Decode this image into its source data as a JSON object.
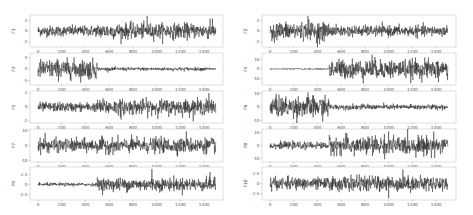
{
  "chart_data": [
    {
      "type": "line",
      "panel": "left-1",
      "ylabel": "F1",
      "x_range": [
        0,
        1500
      ],
      "xticks": [
        0,
        200,
        400,
        600,
        800,
        1000,
        1200,
        1400
      ],
      "yticks": [
        -2,
        0,
        2
      ],
      "ylim": [
        -3,
        3
      ],
      "segments": [
        {
          "from": 0,
          "to": 500,
          "amp": 0.9
        },
        {
          "from": 500,
          "to": 1500,
          "amp": 1.3
        }
      ],
      "spikes": [
        [
          920,
          2.8
        ],
        [
          1450,
          2.3
        ]
      ]
    },
    {
      "type": "line",
      "panel": "left-2",
      "ylabel": "F3",
      "x_range": [
        0,
        1500
      ],
      "xticks": [
        0,
        200,
        400,
        600,
        800,
        1000,
        1200,
        1400
      ],
      "yticks": [
        -5,
        0,
        5
      ],
      "ylim": [
        -7,
        7
      ],
      "segments": [
        {
          "from": 0,
          "to": 500,
          "amp": 3.8
        },
        {
          "from": 500,
          "to": 1500,
          "amp": 0.7
        }
      ],
      "spikes": [
        [
          440,
          -4.5
        ]
      ]
    },
    {
      "type": "line",
      "panel": "left-3",
      "ylabel": "F5",
      "x_range": [
        0,
        1500
      ],
      "xticks": [
        0,
        200,
        400,
        600,
        800,
        1000,
        1200,
        1400
      ],
      "yticks": [
        -2,
        0,
        2
      ],
      "ylim": [
        -2.3,
        2.3
      ],
      "segments": [
        {
          "from": 0,
          "to": 500,
          "amp": 0.6
        },
        {
          "from": 500,
          "to": 1500,
          "amp": 1.0
        }
      ],
      "spikes": [
        [
          700,
          -1.8
        ],
        [
          1440,
          2.0
        ]
      ]
    },
    {
      "type": "line",
      "panel": "left-4",
      "ylabel": "F7",
      "x_range": [
        0,
        1500
      ],
      "xticks": [
        0,
        200,
        400,
        600,
        800,
        1000,
        1200,
        1400
      ],
      "yticks": [
        -10,
        0,
        10
      ],
      "ylim": [
        -11,
        11
      ],
      "segments": [
        {
          "from": 0,
          "to": 500,
          "amp": 4.0
        },
        {
          "from": 500,
          "to": 1500,
          "amp": 4.5
        }
      ],
      "spikes": [
        [
          60,
          8.5
        ],
        [
          1250,
          9.5
        ]
      ]
    },
    {
      "type": "line",
      "panel": "left-5",
      "ylabel": "F9",
      "x_range": [
        0,
        1500
      ],
      "xticks": [
        0,
        200,
        400,
        600,
        800,
        1000,
        1200,
        1400
      ],
      "yticks": [
        -2.5,
        0.0,
        2.5
      ],
      "ylim": [
        -4,
        4.5
      ],
      "segments": [
        {
          "from": 0,
          "to": 500,
          "amp": 0.4
        },
        {
          "from": 500,
          "to": 1500,
          "amp": 1.5
        }
      ],
      "spikes": [
        [
          960,
          4.0
        ],
        [
          1450,
          3.2
        ]
      ]
    },
    {
      "type": "line",
      "panel": "right-1",
      "ylabel": "F2",
      "x_range": [
        0,
        1500
      ],
      "xticks": [
        0,
        200,
        400,
        600,
        800,
        1000,
        1200,
        1400
      ],
      "yticks": [
        -2,
        0,
        2
      ],
      "ylim": [
        -3,
        3
      ],
      "segments": [
        {
          "from": 0,
          "to": 500,
          "amp": 1.5
        },
        {
          "from": 500,
          "to": 1500,
          "amp": 0.9
        }
      ],
      "spikes": [
        [
          320,
          2.8
        ],
        [
          400,
          -3.0
        ]
      ]
    },
    {
      "type": "line",
      "panel": "right-2",
      "ylabel": "F4",
      "x_range": [
        0,
        1500
      ],
      "xticks": [
        0,
        200,
        400,
        600,
        800,
        1000,
        1200,
        1400
      ],
      "yticks": [
        -10,
        0,
        10
      ],
      "ylim": [
        -17,
        17
      ],
      "segments": [
        {
          "from": 0,
          "to": 500,
          "amp": 0.6
        },
        {
          "from": 500,
          "to": 1500,
          "amp": 9.0
        }
      ],
      "spikes": [
        [
          860,
          15
        ],
        [
          1420,
          -14
        ]
      ]
    },
    {
      "type": "line",
      "panel": "right-3",
      "ylabel": "F6",
      "x_range": [
        0,
        1500
      ],
      "xticks": [
        0,
        200,
        400,
        600,
        800,
        1000,
        1200,
        1400
      ],
      "yticks": [
        -10,
        0,
        10
      ],
      "ylim": [
        -12,
        12
      ],
      "segments": [
        {
          "from": 0,
          "to": 500,
          "amp": 7.0
        },
        {
          "from": 500,
          "to": 1500,
          "amp": 1.8
        }
      ],
      "spikes": [
        [
          320,
          11
        ]
      ]
    },
    {
      "type": "line",
      "panel": "right-4",
      "ylabel": "F8",
      "x_range": [
        0,
        1500
      ],
      "xticks": [
        0,
        200,
        400,
        600,
        800,
        1000,
        1200,
        1400
      ],
      "yticks": [
        -10,
        0,
        10
      ],
      "ylim": [
        -13,
        13
      ],
      "segments": [
        {
          "from": 0,
          "to": 500,
          "amp": 2.5
        },
        {
          "from": 500,
          "to": 1500,
          "amp": 6.5
        }
      ],
      "spikes": [
        [
          1000,
          11
        ],
        [
          1380,
          11
        ]
      ]
    },
    {
      "type": "line",
      "panel": "right-5",
      "ylabel": "F10",
      "x_range": [
        0,
        1500
      ],
      "xticks": [
        0,
        200,
        400,
        600,
        800,
        1000,
        1200,
        1400
      ],
      "yticks": [
        -2.5,
        0.0,
        2.5
      ],
      "ylim": [
        -4,
        4
      ],
      "segments": [
        {
          "from": 0,
          "to": 500,
          "amp": 1.3
        },
        {
          "from": 500,
          "to": 1500,
          "amp": 1.6
        }
      ],
      "spikes": [
        [
          1000,
          -3.6
        ],
        [
          1120,
          3.4
        ]
      ]
    }
  ],
  "layout": {
    "columns": [
      {
        "box_x": 30,
        "box_w": 193,
        "x0": 38,
        "x1500": 216
      },
      {
        "box_x": 262,
        "box_w": 194,
        "x0": 270,
        "x1500": 448
      }
    ],
    "rows": [
      {
        "y": 15,
        "h": 32
      },
      {
        "y": 53,
        "h": 32
      },
      {
        "y": 91,
        "h": 32
      },
      {
        "y": 129,
        "h": 33
      },
      {
        "y": 167,
        "h": 33
      }
    ],
    "colors": {
      "line": "#1c1c1c",
      "axes": "#c8c8c8",
      "text": "#555555"
    }
  }
}
